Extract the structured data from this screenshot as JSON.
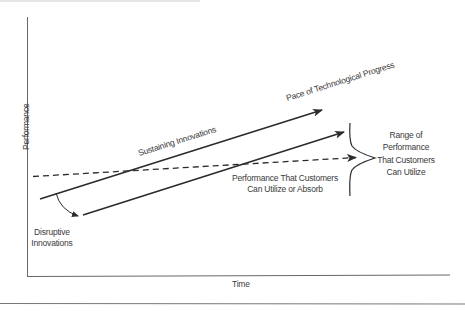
{
  "diagram": {
    "type": "disruptive-innovation-model",
    "axes": {
      "y_label": "Performance",
      "x_label": "Time"
    },
    "lines": [
      {
        "name": "sustaining-innovations",
        "label": "Sustaining Innovations",
        "style": "solid",
        "arrow": true
      },
      {
        "name": "pace-of-technological-progress",
        "label": "Pace of Technological Progress",
        "style": "solid",
        "arrow": true
      },
      {
        "name": "disruptive-innovations",
        "label": "Disruptive Innovations",
        "style": "solid",
        "arrow": true
      },
      {
        "name": "customer-performance",
        "label": "Performance That Customers Can Utilize or Absorb",
        "style": "dashed",
        "arrow": true
      }
    ],
    "labels": {
      "sustaining": "Sustaining Innovations",
      "pace": "Pace of Technological Progress",
      "customers_line1": "Performance That Customers",
      "customers_line2": "Can Utilize or Absorb",
      "disruptive_line1": "Disruptive",
      "disruptive_line2": "Innovations",
      "range_line1": "Range of",
      "range_line2": "Performance",
      "range_line3": "That Customers",
      "range_line4": "Can Utilize"
    },
    "colors": {
      "line": "#2b2b2b",
      "axis": "#555555",
      "text": "#3a3a3a",
      "background": "#ffffff"
    }
  }
}
